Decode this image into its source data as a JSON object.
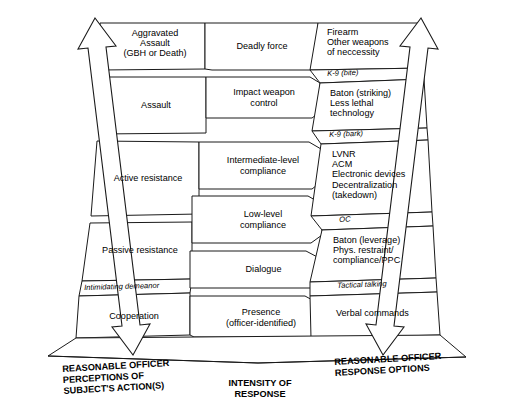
{
  "diagram": {
    "columns": [
      {
        "id": "perceptions",
        "caption": "REASONABLE OFFICER\nPERCEPTIONS OF\nSUBJECT'S ACTION(S)"
      },
      {
        "id": "intensity",
        "caption": "INTENSITY OF\nRESPONSE"
      },
      {
        "id": "response",
        "caption": "REASONABLE OFFICER\nRESPONSE OPTIONS"
      }
    ],
    "subject_actions": [
      {
        "level": 5,
        "label": "Aggravated\nAssault\n(GBH or Death)"
      },
      {
        "level": 4,
        "label": "Assault"
      },
      {
        "level": 3,
        "label": "Active resistance"
      },
      {
        "level": 2,
        "label": "Passive resistance"
      },
      {
        "level": 1,
        "label": "Cooperation"
      }
    ],
    "intensity_levels": [
      {
        "level": 6,
        "label": "Deadly force"
      },
      {
        "level": 5,
        "label": "Impact weapon\ncontrol"
      },
      {
        "level": 4,
        "label": "Intermediate-level\ncompliance"
      },
      {
        "level": 3,
        "label": "Low-level\ncompliance"
      },
      {
        "level": 2,
        "label": "Dialogue"
      },
      {
        "level": 1,
        "label": "Presence\n(officer-identified)"
      }
    ],
    "response_options": [
      {
        "level": 5,
        "label": "Firearm\nOther weapons\nof neccessity"
      },
      {
        "level": 4,
        "label": "Baton (striking)\nLess lethal\ntechnology"
      },
      {
        "level": 3,
        "label": "LVNR\nACM\nElectronic devices\nDecentralization\n(takedown)"
      },
      {
        "level": 2,
        "label": "Baton (leverage)\nPhys. restraint/\ncompliance/PPC"
      },
      {
        "level": 1,
        "label": "Verbal commands"
      }
    ],
    "transition_labels": [
      {
        "id": "k9-bite",
        "label": "K-9 (bite)"
      },
      {
        "id": "k9-bark",
        "label": "K-9 (bark)"
      },
      {
        "id": "oc",
        "label": "OC"
      },
      {
        "id": "intimidating-demeanor",
        "label": "Intimidating demeanor"
      },
      {
        "id": "tactical-talking",
        "label": "Tactical talking"
      }
    ],
    "arrows": [
      {
        "id": "left-arrow",
        "kind": "double-headed-vertical"
      },
      {
        "id": "right-arrow",
        "kind": "double-headed-vertical"
      }
    ],
    "colors": {
      "stroke": "#1a1a1a",
      "fill": "#ffffff",
      "background": "#ffffff"
    }
  }
}
